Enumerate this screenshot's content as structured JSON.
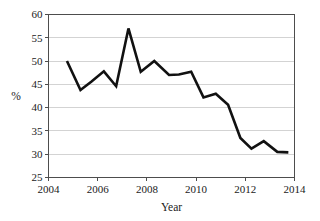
{
  "chart_data": {
    "type": "line",
    "title": "",
    "subtitle": "",
    "xlabel": "Year",
    "ylabel": "%",
    "xlim": [
      2004,
      2014
    ],
    "ylim": [
      25,
      60
    ],
    "xticks": [
      2004,
      2006,
      2008,
      2010,
      2012,
      2014
    ],
    "xticklabels": [
      "2004",
      "2006",
      "2008",
      "2010",
      "2012",
      "2014"
    ],
    "yticks": [
      25,
      30,
      35,
      40,
      45,
      50,
      55,
      60
    ],
    "yticklabels": [
      "25",
      "30",
      "35",
      "40",
      "45",
      "50",
      "55",
      "60"
    ],
    "grid": "horizontal",
    "legend": "none",
    "annotations": [],
    "line_color": "#111111",
    "grid_color": "#c8c8c8",
    "axis_color": "#4d4d4d",
    "series": [
      {
        "name": "percent",
        "x": [
          2004.75,
          2005.3,
          2005.75,
          2006.25,
          2006.75,
          2007.25,
          2007.75,
          2008.3,
          2008.9,
          2009.3,
          2009.8,
          2010.3,
          2010.8,
          2011.3,
          2011.8,
          2012.25,
          2012.75,
          2013.3,
          2013.75
        ],
        "values": [
          50.0,
          43.8,
          45.6,
          47.8,
          44.6,
          57.0,
          47.7,
          50.0,
          47.0,
          47.1,
          47.7,
          42.2,
          43.0,
          40.6,
          33.5,
          31.2,
          32.8,
          30.5,
          30.4
        ]
      }
    ]
  }
}
